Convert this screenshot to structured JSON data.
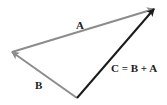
{
  "diagram": {
    "type": "vector-addition-triangle",
    "vectors": [
      {
        "id": "A",
        "label": "A",
        "color": "#8c8c8c",
        "from": [
          12,
          52
        ],
        "to": [
          154,
          9
        ]
      },
      {
        "id": "B",
        "label": "B",
        "color": "#8c8c8c",
        "from": [
          77,
          98
        ],
        "to": [
          12,
          52
        ]
      },
      {
        "id": "C",
        "label": "C = B + A",
        "color": "#1a1a1a",
        "from": [
          77,
          98
        ],
        "to": [
          154,
          9
        ]
      }
    ],
    "labels": {
      "a": "A",
      "b": "B",
      "c": "C = B + A"
    }
  }
}
